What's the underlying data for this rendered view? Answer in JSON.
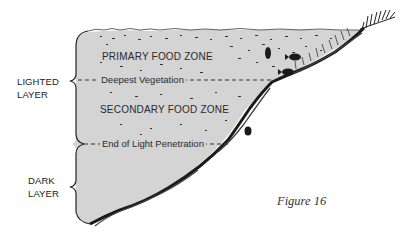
{
  "figure": {
    "caption": "Figure 16",
    "zones": {
      "primary": "PRIMARY FOOD ZONE",
      "secondary": "SECONDARY FOOD ZONE"
    },
    "boundaries": {
      "vegetation": "Deepest Vegetation",
      "light": "End of Light Penetration"
    },
    "layers": {
      "lighted_line1": "LIGHTED",
      "lighted_line2": "LAYER",
      "dark_line1": "DARK",
      "dark_line2": "LAYER"
    },
    "colors": {
      "water": "#d3d3d3",
      "ink": "#1e1e1e",
      "background": "#ffffff"
    }
  }
}
